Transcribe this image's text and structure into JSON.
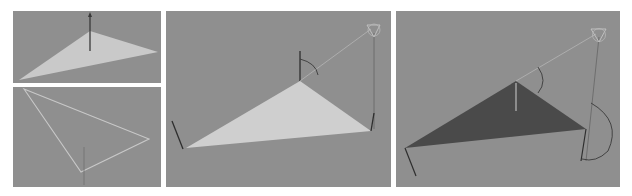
{
  "figure": {
    "panels": [
      {
        "id": "top-left",
        "description": "shaded triangle with normal arrow",
        "triangle_color": "#c9c9c9"
      },
      {
        "id": "bottom-left",
        "description": "wireframe triangle outline",
        "outline_color": "#c8c8c8"
      },
      {
        "id": "middle",
        "description": "lit triangle with light source and vectors",
        "triangle_color": "#cfcfcf"
      },
      {
        "id": "right",
        "description": "dark triangle with light source and angle arcs",
        "triangle_color": "#4a4a4a"
      }
    ],
    "colors": {
      "background": "#ffffff",
      "viewport": "#8f8f8f",
      "vector": "#3a3a3a",
      "light_ray": "#b0b0b0"
    }
  }
}
